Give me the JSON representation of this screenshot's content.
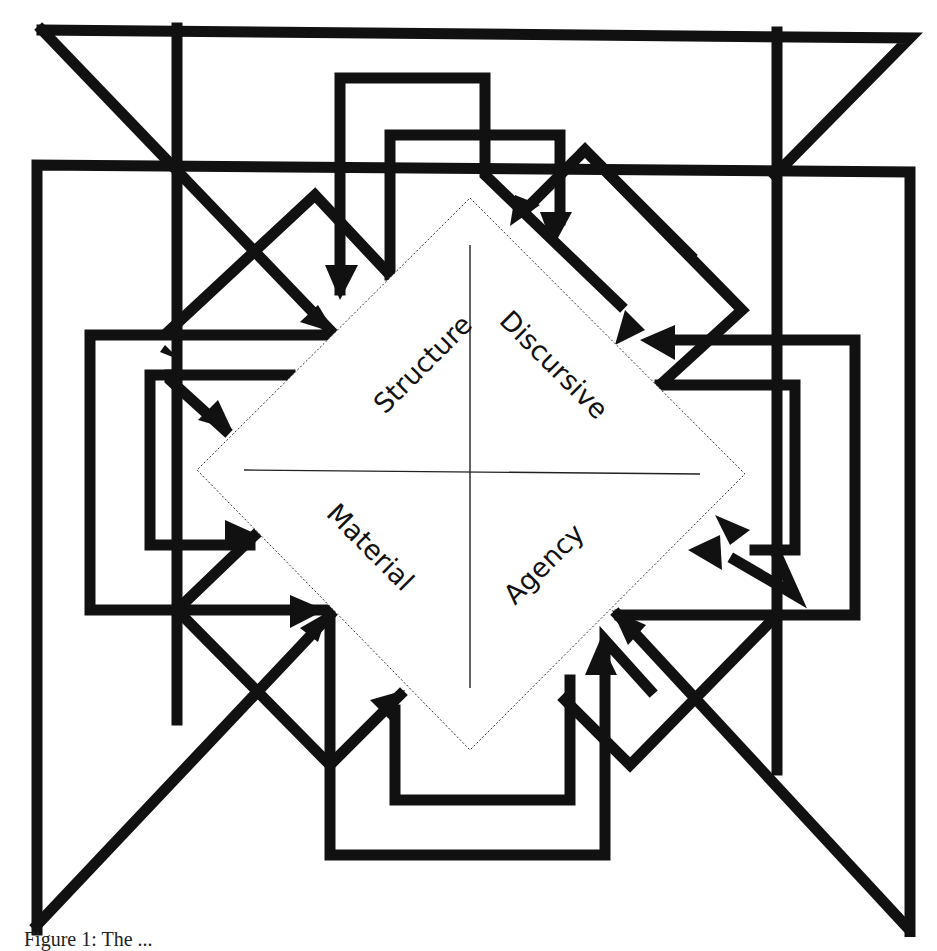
{
  "diagram": {
    "type": "quadrant-diamond-with-arrows",
    "quadrants": {
      "top_left": "Structure",
      "top_right": "Discursive",
      "bottom_left": "Material",
      "bottom_right": "Agency"
    },
    "colors": {
      "line": "#111111",
      "background": "#ffffff",
      "diamond_border": "#333333"
    }
  },
  "caption": {
    "text": "Figure 1: The ...",
    "visible": "partially cut off at bottom edge"
  }
}
